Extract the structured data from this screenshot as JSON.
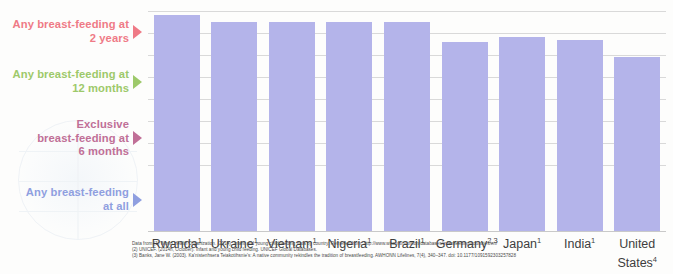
{
  "chart_data": {
    "type": "bar",
    "title": "",
    "subtitle": "",
    "xlabel": "",
    "ylabel": "",
    "stacked": true,
    "grid": true,
    "gridlines_y": [
      100,
      90,
      80,
      70,
      60,
      50,
      40,
      30
    ],
    "ylim": [
      0,
      100
    ],
    "legend_position": "left",
    "categories": [
      "Rwanda",
      "Ukraine",
      "Vietnam",
      "Nigeria",
      "Brazil",
      "Germany",
      "Japan",
      "India",
      "United States"
    ],
    "category_footnote_marks": [
      "1",
      "1",
      "1",
      "1",
      "1",
      "2,3",
      "1",
      "1",
      "4"
    ],
    "series": [
      {
        "name": "Any breast-feeding at all",
        "color": "#b4b4ea",
        "values": [
          98,
          95,
          95,
          95,
          95,
          86,
          88,
          87,
          79
        ]
      },
      {
        "name": "Exclusive breast-feeding at 6 months",
        "color": "#c4809f",
        "values": [
          88,
          82,
          82,
          81,
          83,
          72,
          79,
          74,
          67
        ]
      },
      {
        "name": "Any breast-feeding at 12 months",
        "color": "#b9dd8a",
        "values": [
          68,
          75,
          61,
          61,
          72,
          57,
          61,
          52,
          55
        ]
      },
      {
        "name": "Any breast-feeding at 2 years",
        "color": "#f7848c",
        "values": [
          41,
          69,
          54,
          51,
          64,
          50,
          54,
          31,
          0
        ]
      }
    ]
  },
  "legend": {
    "items": [
      {
        "id": "legend-2-years",
        "line1": "Any breast-feeding at",
        "line2": "2 years",
        "color": "#ef7a86"
      },
      {
        "id": "legend-12-months",
        "line1": "Any breast-feeding at",
        "line2": "12 months",
        "color": "#9dc96a"
      },
      {
        "id": "legend-6-months",
        "line1": "Exclusive",
        "line2": "breast-feeding at",
        "line3": "6 months",
        "color": "#c06f97"
      },
      {
        "id": "legend-all",
        "line1": "Any breast-feeding",
        "line2": "at all",
        "color": "#8f9fe0"
      }
    ]
  },
  "xaxis": {
    "labels": [
      {
        "name": "Rwanda",
        "mark": "1"
      },
      {
        "name": "Ukraine",
        "mark": "1"
      },
      {
        "name": "Vietnam",
        "mark": "1"
      },
      {
        "name": "Nigeria",
        "mark": "1"
      },
      {
        "name": "Brazil",
        "mark": "1"
      },
      {
        "name": "Germany",
        "mark": "2,3"
      },
      {
        "name": "Japan",
        "mark": "1"
      },
      {
        "name": "India",
        "mark": "1"
      },
      {
        "name": "United",
        "mark": "4",
        "line2": "States"
      }
    ]
  },
  "footnotes": {
    "line1": "Data from (1) World Health Organization. (2014). Infant and young child feeding data by country. Retrieved from: http://www.who.int/nutrition/databases/infantfeeding/countries/en/",
    "line2": "(2) UNICEF. (2014h, October). Infant and young child feeding. UNICEF Global Databases.",
    "line3": "(3) Banks, Jane W. (2003). Ka'nistenhsera Teiakotihsnie's: A native community rekindles the tradition of breastfeeding. AWHONN Lifelines, 7(4), 340–347. doi: 10.1177/1091592303257828"
  },
  "colors": {
    "any_breastfeeding": "#b4b4ea",
    "exclusive_6_months": "#c4809f",
    "any_12_months": "#b9dd8a",
    "any_2_years": "#f7848c",
    "gridline": "#d9d9d9"
  }
}
